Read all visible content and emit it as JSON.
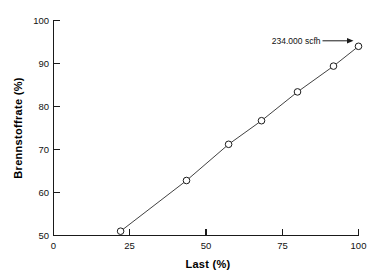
{
  "chart_data": {
    "type": "line",
    "title": "",
    "xlabel": "Last  (%)",
    "ylabel": "Brennstoffrate  (%)",
    "xlim": [
      0,
      100
    ],
    "ylim": [
      50,
      100
    ],
    "xticks": [
      0,
      25,
      50,
      75,
      100
    ],
    "yticks": [
      50,
      60,
      70,
      80,
      90,
      100
    ],
    "xtick_labels": [
      "0",
      "25",
      "50",
      "75",
      "100"
    ],
    "ytick_labels": [
      "50",
      "60",
      "70",
      "80",
      "90",
      "100"
    ],
    "grid": false,
    "legend": false,
    "marker": "open-circle",
    "series": [
      {
        "name": "Brennstoffrate",
        "x": [
          22.0,
          43.6,
          57.4,
          68.2,
          80.0,
          91.8,
          100.0
        ],
        "y": [
          51.0,
          62.8,
          71.2,
          76.7,
          83.4,
          89.4,
          94.0
        ]
      }
    ],
    "annotations": [
      {
        "text": "234.000 scfh",
        "target_x": 100.0,
        "target_y": 94.0,
        "arrow": true
      }
    ]
  },
  "axis": {
    "x_title": "Last  (%)",
    "y_title": "Brennstoffrate  (%)"
  }
}
